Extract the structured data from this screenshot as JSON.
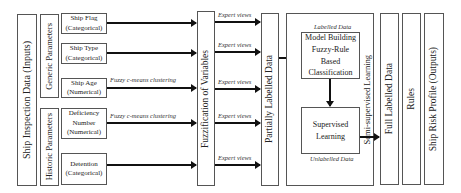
{
  "inputs": {
    "title": "Ship Inspection Data (Inputs)",
    "generic": {
      "title": "Generic Parameters",
      "params": [
        {
          "name": "Ship Flag",
          "type": "(Categorical)"
        },
        {
          "name": "Ship Type",
          "type": "(Categorical)"
        },
        {
          "name": "Ship Age",
          "type": "(Numerical)"
        }
      ]
    },
    "historic": {
      "title": "Historic Parameters",
      "params": [
        {
          "name": "Deficiency",
          "name2": "Number",
          "type": "(Numerical)"
        },
        {
          "name": "Detention",
          "type": "(Categorical)"
        }
      ]
    }
  },
  "arrows": {
    "ship_age_label": "Fuzzy c-means clustering",
    "deficiency_label": "Fuzzy c-means clustering",
    "expert_label": "Expert views"
  },
  "stages": {
    "fuzzification": "Fuzzification of Variables",
    "partially_labelled": "Partially Labelled Data",
    "semi_supervised": {
      "title": "Semi-supervised Learning",
      "labelled_caption": "Labelled Data",
      "model_building": [
        "Model Building",
        "Fuzzy-Rule",
        "Based",
        "Classification"
      ],
      "supervised": [
        "Supervised",
        "Learning"
      ],
      "unlabelled_caption": "Unlabelled Data"
    },
    "full_labelled": "Full Labelled Data",
    "rules": "Rules",
    "output": "Ship Risk Profile (Outputs)"
  }
}
